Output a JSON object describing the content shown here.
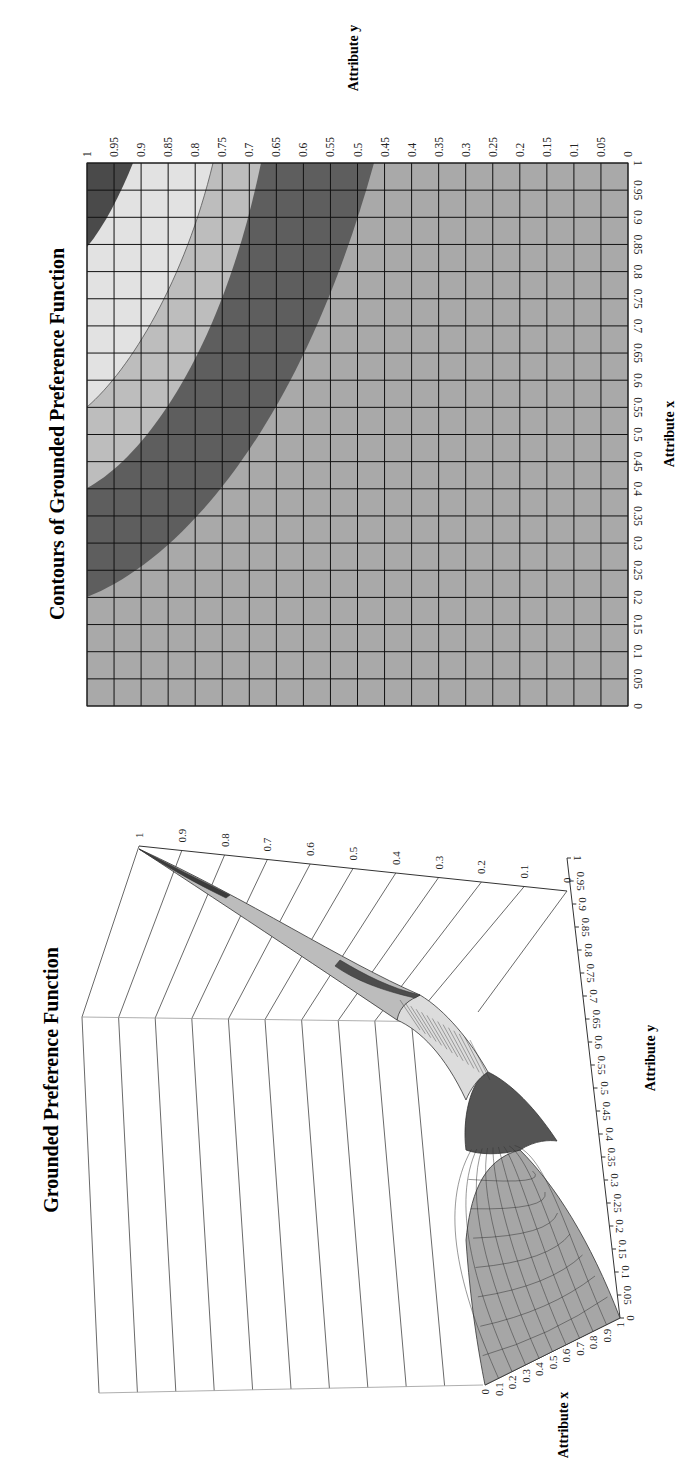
{
  "page": {
    "orientation": "rotated-90-ccw"
  },
  "contour_chart": {
    "title": "Contours of Grounded Preference Function",
    "xlabel": "Attribute x",
    "ylabel": "Attribute y",
    "x_ticks": [
      "0",
      "0.05",
      "0.1",
      "0.15",
      "0.2",
      "0.25",
      "0.3",
      "0.35",
      "0.4",
      "0.45",
      "0.5",
      "0.55",
      "0.6",
      "0.65",
      "0.7",
      "0.75",
      "0.8",
      "0.85",
      "0.9",
      "0.95",
      "1"
    ],
    "y_ticks": [
      "0",
      "0.05",
      "0.1",
      "0.15",
      "0.2",
      "0.25",
      "0.3",
      "0.35",
      "0.4",
      "0.45",
      "0.5",
      "0.55",
      "0.6",
      "0.65",
      "0.7",
      "0.75",
      "0.8",
      "0.85",
      "0.9",
      "0.95",
      "1"
    ],
    "colors": {
      "band_low": "#a9a9a9",
      "band_dark": "#5e5e5e",
      "band_mid": "#bdbdbd",
      "band_light": "#e2e2e2",
      "band_top": "#4a4a4a",
      "grid": "#111111"
    }
  },
  "surface_chart": {
    "title": "Grounded Preference Function",
    "xlabel": "Attribute x",
    "ylabel": "Attribute y",
    "z_ticks": [
      "1",
      "0.9",
      "0.8",
      "0.7",
      "0.6",
      "0.5",
      "0.4",
      "0.3",
      "0.2",
      "0.1",
      "0"
    ],
    "y_ticks": [
      "1",
      "0.95",
      "0.9",
      "0.85",
      "0.8",
      "0.75",
      "0.7",
      "0.65",
      "0.6",
      "0.55",
      "0.5",
      "0.45",
      "0.4",
      "0.35",
      "0.3",
      "0.25",
      "0.2",
      "0.15",
      "0.1",
      "0.05",
      "0"
    ],
    "x_ticks": [
      "0",
      "0.1",
      "0.2",
      "0.3",
      "0.4",
      "0.5",
      "0.6",
      "0.7",
      "0.8",
      "0.9",
      "1"
    ]
  },
  "chart_data": [
    {
      "type": "heatmap",
      "title": "Contours of Grounded Preference Function",
      "xlabel": "Attribute x",
      "ylabel": "Attribute y",
      "xlim": [
        0,
        1
      ],
      "ylim": [
        0,
        1
      ],
      "grid": true,
      "tick_step": 0.05,
      "description": "Filled contour bands of preference function u(x,y); value increases toward (1,1)",
      "bands": [
        {
          "region": "lowest",
          "shade": "medium gray",
          "boundary_left_x_at_y1": 0.2,
          "boundary_top_y_at_x1": 0.455
        },
        {
          "region": "band 2",
          "shade": "dark gray",
          "from_x_at_y1": 0.2,
          "to_x_at_y1": 0.4,
          "from_y_at_x1": 0.455,
          "to_y_at_x1": 0.64
        },
        {
          "region": "band 3",
          "shade": "light gray",
          "from_x_at_y1": 0.4,
          "to_x_at_y1": 0.55,
          "from_y_at_x1": 0.64,
          "to_y_at_x1": 0.78
        },
        {
          "region": "band 4",
          "shade": "very light gray",
          "from_x_at_y1": 0.55,
          "to_x_at_y1": 0.845,
          "from_y_at_x1": 0.78,
          "to_y_at_x1": 0.915
        },
        {
          "region": "highest",
          "shade": "dark gray",
          "from_x_at_y1": 0.845,
          "to_x_at_y1": 1.0,
          "from_y_at_x1": 0.915,
          "to_y_at_x1": 1.0
        }
      ]
    },
    {
      "type": "surface",
      "title": "Grounded Preference Function",
      "xlabel": "Attribute x",
      "ylabel": "Attribute y",
      "zlabel": "",
      "xlim": [
        0,
        1
      ],
      "ylim": [
        0,
        1
      ],
      "zlim": [
        0,
        1
      ],
      "x_tick_step": 0.1,
      "y_tick_step": 0.05,
      "z_tick_step": 0.1,
      "key_points": [
        {
          "x": 0,
          "y": 0,
          "z": 0
        },
        {
          "x": 1,
          "y": 0,
          "z": 0
        },
        {
          "x": 0,
          "y": 1,
          "z": 0
        },
        {
          "x": 1,
          "y": 1,
          "z": 1
        }
      ],
      "description": "Surface rises from 0 at the x=0 / y=0 edges to 1 at (1,1); shaded with same contour bands as contour chart"
    }
  ]
}
